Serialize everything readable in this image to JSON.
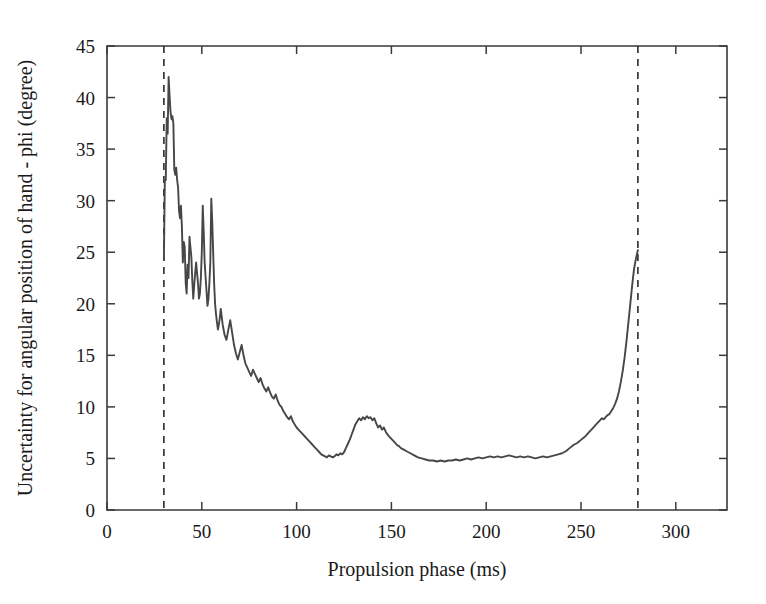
{
  "figure": {
    "background_color": "#ffffff",
    "line_color": "#474747",
    "axis_color": "#3a3a3a",
    "marker_color": "#2b2b2b"
  },
  "chart_data": {
    "type": "line",
    "title": "",
    "subtitle": "",
    "xlabel": "Propulsion phase (ms)",
    "ylabel": "Uncertainty for angular position of hand - phi (degree)",
    "xlim": [
      0,
      327
    ],
    "ylim": [
      0,
      45
    ],
    "xticks": [
      0,
      50,
      100,
      150,
      200,
      250,
      300
    ],
    "xtick_labels": [
      "0",
      "50",
      "100",
      "150",
      "200",
      "250",
      "300"
    ],
    "yticks": [
      0,
      5,
      10,
      15,
      20,
      25,
      30,
      35,
      40,
      45
    ],
    "ytick_labels": [
      "0",
      "5",
      "10",
      "15",
      "20",
      "25",
      "30",
      "35",
      "40",
      "45"
    ],
    "grid": false,
    "legend": null,
    "legend_position": "none",
    "annotations": [
      {
        "name": "start-marker",
        "type": "vertical-dashed-line",
        "x": 30,
        "label": ""
      },
      {
        "name": "end-marker",
        "type": "vertical-dashed-line",
        "x": 280,
        "label": ""
      }
    ],
    "series": [
      {
        "name": "Uncertainty for angular position of hand - phi",
        "x": [
          30.0,
          30.5,
          31.0,
          31.5,
          32.0,
          32.5,
          33.0,
          33.5,
          34.0,
          34.5,
          35.0,
          35.5,
          36.0,
          36.5,
          37.0,
          37.5,
          38.0,
          38.5,
          39.0,
          39.5,
          40.0,
          40.5,
          41.0,
          41.5,
          42.0,
          42.5,
          43.0,
          43.5,
          44.0,
          44.5,
          45.0,
          45.5,
          46.0,
          46.5,
          47.0,
          47.5,
          48.0,
          48.5,
          49.0,
          49.5,
          50.0,
          50.5,
          51.0,
          51.5,
          52.0,
          52.5,
          53.0,
          53.5,
          54.0,
          54.5,
          55.0,
          55.5,
          56.0,
          56.5,
          57.0,
          57.5,
          58.0,
          58.5,
          59.0,
          59.5,
          60.0,
          61.0,
          62.0,
          63.0,
          64.0,
          65.0,
          66.0,
          67.0,
          68.0,
          69.0,
          70.0,
          71.0,
          72.0,
          73.0,
          74.0,
          75.0,
          76.0,
          77.0,
          78.0,
          79.0,
          80.0,
          81.0,
          82.0,
          83.0,
          84.0,
          85.0,
          86.0,
          87.0,
          88.0,
          89.0,
          90.0,
          91.0,
          92.0,
          93.0,
          94.0,
          95.0,
          96.0,
          97.0,
          98.0,
          99.0,
          100.0,
          101.0,
          102.0,
          103.0,
          104.0,
          105.0,
          106.0,
          107.0,
          108.0,
          109.0,
          110.0,
          111.0,
          112.0,
          113.0,
          114.0,
          115.0,
          116.0,
          117.0,
          118.0,
          119.0,
          120.0,
          121.0,
          122.0,
          123.0,
          124.0,
          125.0,
          126.0,
          127.0,
          128.0,
          129.0,
          130.0,
          131.0,
          132.0,
          133.0,
          134.0,
          135.0,
          136.0,
          137.0,
          138.0,
          139.0,
          140.0,
          141.0,
          142.0,
          143.0,
          144.0,
          145.0,
          146.0,
          147.0,
          148.0,
          149.0,
          150.0,
          151.0,
          152.0,
          153.0,
          154.0,
          155.0,
          156.0,
          157.0,
          158.0,
          159.0,
          160.0,
          162.0,
          164.0,
          166.0,
          168.0,
          170.0,
          172.0,
          174.0,
          176.0,
          178.0,
          180.0,
          182.0,
          184.0,
          186.0,
          188.0,
          190.0,
          192.0,
          194.0,
          196.0,
          198.0,
          200.0,
          202.0,
          204.0,
          206.0,
          208.0,
          210.0,
          212.0,
          214.0,
          216.0,
          218.0,
          220.0,
          222.0,
          224.0,
          226.0,
          228.0,
          230.0,
          232.0,
          234.0,
          236.0,
          238.0,
          240.0,
          242.0,
          244.0,
          246.0,
          248.0,
          250.0,
          252.0,
          254.0,
          256.0,
          258.0,
          260.0,
          261.0,
          262.0,
          263.0,
          264.0,
          265.0,
          266.0,
          267.0,
          268.0,
          269.0,
          270.0,
          271.0,
          272.0,
          273.0,
          274.0,
          275.0,
          276.0,
          277.0,
          278.0,
          279.0,
          280.0
        ],
        "values": [
          24.3,
          31.9,
          32.0,
          38.0,
          36.5,
          42.0,
          40.2,
          38.6,
          37.9,
          38.2,
          37.5,
          33.0,
          32.5,
          33.2,
          32.0,
          31.3,
          29.0,
          28.3,
          29.5,
          27.5,
          24.0,
          26.0,
          25.5,
          22.0,
          21.0,
          23.8,
          22.5,
          26.5,
          25.5,
          24.5,
          22.2,
          20.5,
          21.8,
          23.0,
          24.0,
          23.0,
          22.0,
          20.5,
          21.0,
          22.5,
          25.0,
          29.5,
          27.0,
          24.0,
          22.6,
          21.2,
          19.8,
          20.5,
          22.0,
          24.0,
          30.2,
          28.0,
          25.0,
          22.0,
          20.0,
          19.0,
          18.2,
          17.5,
          18.0,
          18.6,
          19.5,
          18.0,
          17.0,
          16.5,
          17.5,
          18.4,
          17.2,
          16.0,
          15.2,
          14.6,
          15.3,
          16.0,
          15.0,
          14.2,
          13.8,
          13.4,
          13.0,
          13.6,
          13.2,
          12.8,
          12.4,
          12.8,
          12.2,
          11.8,
          11.5,
          11.9,
          11.4,
          11.0,
          10.8,
          11.2,
          10.6,
          10.2,
          10.0,
          9.6,
          9.3,
          9.0,
          8.8,
          9.1,
          8.6,
          8.3,
          8.0,
          7.8,
          7.6,
          7.4,
          7.2,
          7.0,
          6.8,
          6.6,
          6.4,
          6.2,
          6.0,
          5.8,
          5.6,
          5.4,
          5.3,
          5.2,
          5.1,
          5.3,
          5.2,
          5.1,
          5.2,
          5.4,
          5.3,
          5.5,
          5.4,
          5.6,
          6.0,
          6.4,
          6.8,
          7.3,
          7.8,
          8.3,
          8.6,
          8.9,
          8.7,
          9.0,
          8.8,
          9.1,
          8.9,
          9.0,
          8.7,
          8.9,
          8.4,
          8.0,
          8.2,
          7.8,
          8.0,
          7.6,
          7.3,
          7.1,
          6.9,
          6.7,
          6.5,
          6.3,
          6.2,
          6.0,
          5.9,
          5.8,
          5.7,
          5.6,
          5.5,
          5.3,
          5.1,
          5.0,
          4.9,
          4.8,
          4.8,
          4.7,
          4.8,
          4.7,
          4.8,
          4.8,
          4.9,
          4.8,
          4.9,
          5.0,
          4.9,
          5.0,
          5.1,
          5.0,
          5.1,
          5.2,
          5.1,
          5.2,
          5.1,
          5.2,
          5.3,
          5.2,
          5.1,
          5.2,
          5.1,
          5.2,
          5.1,
          5.0,
          5.1,
          5.2,
          5.1,
          5.2,
          5.3,
          5.4,
          5.5,
          5.7,
          6.0,
          6.3,
          6.5,
          6.8,
          7.1,
          7.5,
          7.9,
          8.3,
          8.7,
          8.9,
          8.8,
          9.0,
          9.2,
          9.3,
          9.6,
          9.9,
          10.3,
          10.8,
          11.5,
          12.4,
          13.5,
          14.8,
          16.4,
          18.2,
          20.0,
          21.8,
          23.4,
          24.4,
          25.2
        ]
      }
    ]
  }
}
